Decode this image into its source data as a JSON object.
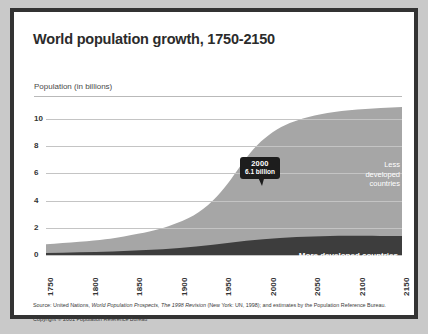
{
  "figure": {
    "title": "World population growth, 1750-2150",
    "axis_label": "Population (in billions)",
    "source": "Source: United Nations, ",
    "source_italic": "World Population Prospects, The 1998 Revision",
    "source_tail": " (New York: UN, 1998); and estimates by the Population Reference Bureau.",
    "copyright": "Copyright © 2001 Population Reference Bureau"
  },
  "annotations": {
    "callout_year": "2000",
    "callout_value": "6.1 billion",
    "less_developed": "Less\ndeveloped\ncountries",
    "more_developed": "More developed countries"
  },
  "colors": {
    "frame": "#333333",
    "page_background": "#c9c9c9",
    "panel": "#ffffff",
    "less_developed": "#a6a6a6",
    "more_developed": "#3d3d3d",
    "gridline": "#c4c4c4",
    "callout": "#1d1d1d",
    "text": "#333333"
  },
  "chart_data": {
    "type": "area",
    "stacked": true,
    "title": "World population growth, 1750-2150",
    "xlabel": "",
    "ylabel": "Population (in billions)",
    "xlim": [
      1750,
      2150
    ],
    "ylim": [
      0,
      11
    ],
    "yticks": [
      0,
      2,
      4,
      6,
      8,
      10
    ],
    "xticks": [
      1750,
      1800,
      1850,
      1900,
      1950,
      2000,
      2050,
      2100,
      2150
    ],
    "grid": true,
    "legend": "inline-labels",
    "x": [
      1750,
      1800,
      1850,
      1900,
      1950,
      1975,
      2000,
      2025,
      2050,
      2075,
      2100,
      2125,
      2150
    ],
    "series": [
      {
        "name": "More developed countries",
        "values": [
          0.15,
          0.2,
          0.26,
          0.4,
          0.81,
          1.05,
          1.19,
          1.25,
          1.28,
          1.25,
          1.22,
          1.2,
          1.18
        ]
      },
      {
        "name": "Less developed countries",
        "values": [
          0.64,
          0.71,
          0.94,
          1.2,
          1.71,
          3.01,
          4.87,
          6.8,
          7.75,
          8.5,
          9.0,
          9.2,
          9.3
        ]
      }
    ],
    "totals": [
      0.79,
      0.91,
      1.2,
      1.6,
      2.52,
      4.06,
      6.06,
      8.05,
      9.03,
      9.75,
      10.22,
      10.4,
      10.48
    ],
    "annotations": [
      {
        "x": 2000,
        "y": 6.1,
        "label": "2000 6.1 billion"
      }
    ]
  }
}
